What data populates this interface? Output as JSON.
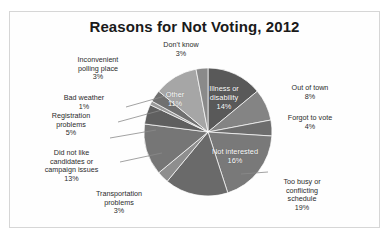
{
  "chart_data": {
    "type": "pie",
    "title": "Reasons for Not Voting, 2012",
    "xlabel": "",
    "ylabel": "",
    "legend": "none (direct labels)",
    "grid": false,
    "units": "percent",
    "categories": [
      "Illness or disability",
      "Out of town",
      "Forgot to vote",
      "Too busy or conflicting schedule",
      "Not interested",
      "Transportation problems",
      "Did not like candidates or campaign issues",
      "Registration problems",
      "Bad weather",
      "Inconvenient polling place",
      "Other",
      "Don't know"
    ],
    "values": [
      14,
      8,
      4,
      19,
      16,
      3,
      13,
      5,
      1,
      3,
      11,
      3
    ],
    "slice_colors": [
      "#595959",
      "#848484",
      "#6d6d6d",
      "#797979",
      "#6a6a6a",
      "#8e8e8e",
      "#767676",
      "#5f5f5f",
      "#9a9a9a",
      "#707070",
      "#a6a6a6",
      "#8a8a8a"
    ]
  },
  "labels": [
    {
      "key": "dont-know",
      "text": "Don't know\n3%"
    },
    {
      "key": "inconvenient",
      "text": "Inconvenient\npolling place\n3%"
    },
    {
      "key": "bad-weather",
      "text": "Bad weather\n1%"
    },
    {
      "key": "registration",
      "text": "Registration\nproblems\n5%"
    },
    {
      "key": "candidates",
      "text": "Did not like\ncandidates or\ncampaign issues\n13%"
    },
    {
      "key": "transportation",
      "text": "Transportation\nproblems\n3%"
    },
    {
      "key": "too-busy",
      "text": "Too busy or\nconflicting\nschedule\n19%"
    },
    {
      "key": "forgot",
      "text": "Forgot to vote\n4%"
    },
    {
      "key": "out-of-town",
      "text": "Out of town\n8%"
    }
  ],
  "inside_labels": [
    {
      "key": "other",
      "text": "Other\n11%"
    },
    {
      "key": "illness",
      "text": "Illness or\ndisability\n14%"
    },
    {
      "key": "not-interested",
      "text": "Not interested\n16%"
    }
  ],
  "colors": {
    "frame_border": "#d6d6d6",
    "background": "#ffffff",
    "title_text": "#1a1a1a",
    "label_text": "#2b2b2b",
    "inside_label_text": "#ffffff",
    "leader_line": "#8a8a8a"
  }
}
